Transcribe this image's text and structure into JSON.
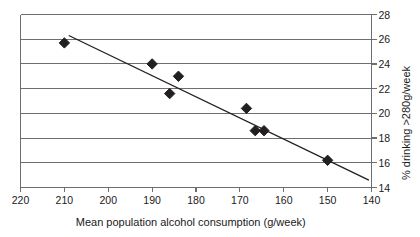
{
  "chart_data": {
    "type": "scatter",
    "title": "",
    "xlabel": "Mean population alcohol consumption (g/week)",
    "ylabel": "% drinking >280g/week",
    "xlim": [
      220,
      140
    ],
    "ylim": [
      14,
      28
    ],
    "x_reversed": true,
    "grid": "horizontal",
    "legend": "none",
    "x_ticks": [
      220,
      210,
      200,
      190,
      180,
      170,
      160,
      150,
      140
    ],
    "y_ticks": [
      14,
      16,
      18,
      20,
      22,
      24,
      26,
      28
    ],
    "x_tick_labels": [
      "220",
      "210",
      "200",
      "190",
      "180",
      "170",
      "160",
      "150",
      "140"
    ],
    "y_tick_labels": [
      "14",
      "16",
      "18",
      "20",
      "22",
      "24",
      "26",
      "28"
    ],
    "y_axis_position": "right",
    "marker": "diamond",
    "marker_color": "#231f20",
    "points": [
      {
        "x": 210.0,
        "y": 25.7
      },
      {
        "x": 190.0,
        "y": 24.0
      },
      {
        "x": 184.0,
        "y": 23.0
      },
      {
        "x": 186.0,
        "y": 21.6
      },
      {
        "x": 168.5,
        "y": 20.4
      },
      {
        "x": 166.5,
        "y": 18.6
      },
      {
        "x": 164.5,
        "y": 18.6
      },
      {
        "x": 150.0,
        "y": 16.2
      }
    ],
    "trendline": {
      "type": "linear",
      "x_start": 209.0,
      "y_start": 26.3,
      "x_end": 140.6,
      "y_end": 14.6,
      "color": "#231f20"
    },
    "colors": {
      "axis": "#6d6e71",
      "grid": "#6d6e71",
      "marker": "#231f20",
      "trendline": "#231f20",
      "text": "#1a1a1a",
      "background": "#ffffff"
    }
  }
}
